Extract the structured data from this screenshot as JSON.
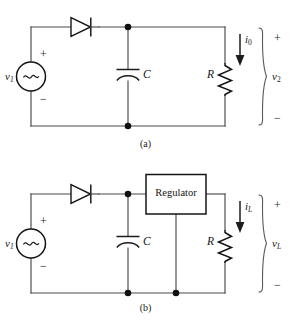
{
  "figure": {
    "background_color": "#ffffff",
    "wire_color": "#4a4a4a",
    "component_color": "#141414",
    "panels": [
      {
        "id": "panel-a",
        "caption": "(a)",
        "title": "Half-wave rectifier with capacitor filter",
        "components": [
          {
            "name": "source",
            "type": "ac-voltage-source",
            "label": "v",
            "subscript": "1",
            "plus": "+",
            "minus": "−",
            "symbol": "~"
          },
          {
            "name": "diode",
            "type": "diode",
            "label": ""
          },
          {
            "name": "capacitor",
            "type": "capacitor-polarized",
            "label": "C"
          },
          {
            "name": "resistor",
            "type": "resistor",
            "label": "R"
          }
        ],
        "annotations": [
          {
            "name": "output-current",
            "label": "i",
            "subscript": "0",
            "direction": "down"
          },
          {
            "name": "output-voltage",
            "label": "v",
            "subscript": "2",
            "plus": "+",
            "minus": "−"
          }
        ]
      },
      {
        "id": "panel-b",
        "caption": "(b)",
        "title": "Regulated DC power supply",
        "components": [
          {
            "name": "source",
            "type": "ac-voltage-source",
            "label": "v",
            "subscript": "1",
            "plus": "+",
            "minus": "−",
            "symbol": "~"
          },
          {
            "name": "diode",
            "type": "diode",
            "label": ""
          },
          {
            "name": "capacitor",
            "type": "capacitor-polarized",
            "label": "C"
          },
          {
            "name": "regulator",
            "type": "block",
            "label": "Regulator"
          },
          {
            "name": "resistor",
            "type": "resistor",
            "label": "R"
          }
        ],
        "annotations": [
          {
            "name": "load-current",
            "label": "i",
            "subscript": "L",
            "direction": "down"
          },
          {
            "name": "load-voltage",
            "label": "v",
            "subscript": "L",
            "plus": "+",
            "minus": "−"
          }
        ]
      }
    ]
  },
  "labels": {
    "a": {
      "v1": "v",
      "v1_sub": "1",
      "src_plus": "+",
      "src_minus": "−",
      "cap": "C",
      "res": "R",
      "i_out": "i",
      "i_out_sub": "0",
      "v_out": "v",
      "v_out_sub": "2",
      "out_plus": "+",
      "out_minus": "−",
      "caption": "(a)"
    },
    "b": {
      "v1": "v",
      "v1_sub": "1",
      "src_plus": "+",
      "src_minus": "−",
      "cap": "C",
      "res": "R",
      "regulator": "Regulator",
      "i_out": "i",
      "i_out_sub": "L",
      "v_out": "v",
      "v_out_sub": "L",
      "out_plus": "+",
      "out_minus": "−",
      "caption": "(b)"
    }
  }
}
